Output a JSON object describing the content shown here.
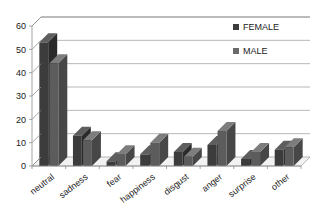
{
  "chart_data": {
    "type": "bar",
    "title": "",
    "subtitle": "",
    "xlabel": "",
    "ylabel": "",
    "categories": [
      "neutral",
      "sadness",
      "fear",
      "happiness",
      "disgust",
      "anger",
      "surprise",
      "other"
    ],
    "series": [
      {
        "name": "FEMALE",
        "color": "#3c3c3c",
        "values": [
          53,
          13,
          2,
          5,
          6,
          9,
          3,
          7
        ]
      },
      {
        "name": "MALE",
        "color": "#6a6a6a",
        "values": [
          44,
          11,
          5,
          10,
          4,
          15,
          6,
          8
        ]
      }
    ],
    "ylim": [
      0,
      60
    ],
    "yticks": [
      0,
      10,
      20,
      30,
      40,
      50,
      60
    ],
    "ytick_labels": [
      "0",
      "10",
      "20",
      "30",
      "40",
      "50",
      "60"
    ],
    "grid": true,
    "grid_axis": "y",
    "legend_position": "top-right",
    "style": "3d-column",
    "annotations": []
  },
  "legend": {
    "entries": [
      {
        "label": "FEMALE",
        "color": "#3c3c3c"
      },
      {
        "label": "MALE",
        "color": "#6a6a6a"
      }
    ]
  },
  "axes": {
    "y_tick_labels": [
      "60",
      "50",
      "40",
      "30",
      "20",
      "10",
      "0"
    ],
    "x_tick_labels": [
      "neutral",
      "sadness",
      "fear",
      "happiness",
      "disgust",
      "anger",
      "surprise",
      "other"
    ]
  }
}
